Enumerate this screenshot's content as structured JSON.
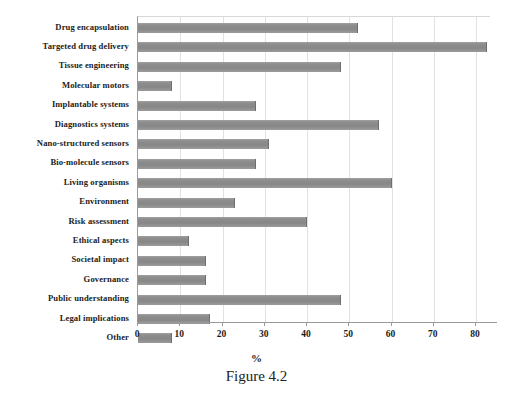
{
  "chart_data": {
    "type": "bar",
    "orientation": "horizontal",
    "title": "",
    "xlabel": "%",
    "ylabel": "",
    "xlim": [
      0,
      80
    ],
    "xticks": [
      0,
      10,
      20,
      30,
      40,
      50,
      60,
      70,
      80
    ],
    "grid": true,
    "legend": false,
    "bar_color": "#8a8a8a",
    "categories": [
      "Drug encapsulation",
      "Targeted drug delivery",
      "Tissue engineering",
      "Molecular motors",
      "Implantable systems",
      "Diagnostics systems",
      "Nano-structured sensors",
      "Bio-molecule sensors",
      "Living organisms",
      "Environment",
      "Risk assessment",
      "Ethical aspects",
      "Societal impact",
      "Governance",
      "Public understanding",
      "Legal implications",
      "Other"
    ],
    "values": [
      52,
      82.5,
      48,
      8,
      28,
      57,
      31,
      28,
      60,
      23,
      40,
      12,
      16,
      16,
      48,
      17,
      8
    ]
  },
  "caption": {
    "text": "Figure 4.2"
  }
}
